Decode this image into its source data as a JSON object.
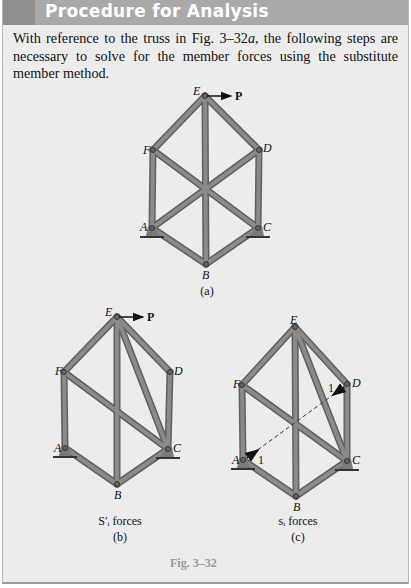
{
  "header": {
    "title": "Procedure for Analysis"
  },
  "intro": {
    "text": "With reference to the truss in Fig. 3–32a, the following steps are necessary to solve for the member forces using the substitute member method."
  },
  "figure": {
    "number": "Fig. 3–32",
    "panels": [
      {
        "id": "a",
        "caption": "(a)",
        "nodes": [
          "E",
          "F",
          "D",
          "A",
          "C",
          "B"
        ],
        "load": "P",
        "members": [
          "EF",
          "ED",
          "EB",
          "FA",
          "DC",
          "FC",
          "AD",
          "AB",
          "CB"
        ]
      },
      {
        "id": "b",
        "caption": "(b)",
        "subtitle": "S′ᵢ forces",
        "nodes": [
          "E",
          "F",
          "D",
          "A",
          "C",
          "B"
        ],
        "load": "P",
        "members": [
          "EF",
          "ED",
          "EB",
          "EC",
          "FA",
          "DC",
          "FC",
          "AB",
          "CB"
        ]
      },
      {
        "id": "c",
        "caption": "(c)",
        "subtitle": "sᵢ forces",
        "nodes": [
          "E",
          "F",
          "D",
          "A",
          "C",
          "B"
        ],
        "unit_loads": [
          "1",
          "1"
        ],
        "members": [
          "EF",
          "ED",
          "EB",
          "EC",
          "FA",
          "DC",
          "FC",
          "AB",
          "CB"
        ],
        "dashed": "AD"
      }
    ]
  }
}
